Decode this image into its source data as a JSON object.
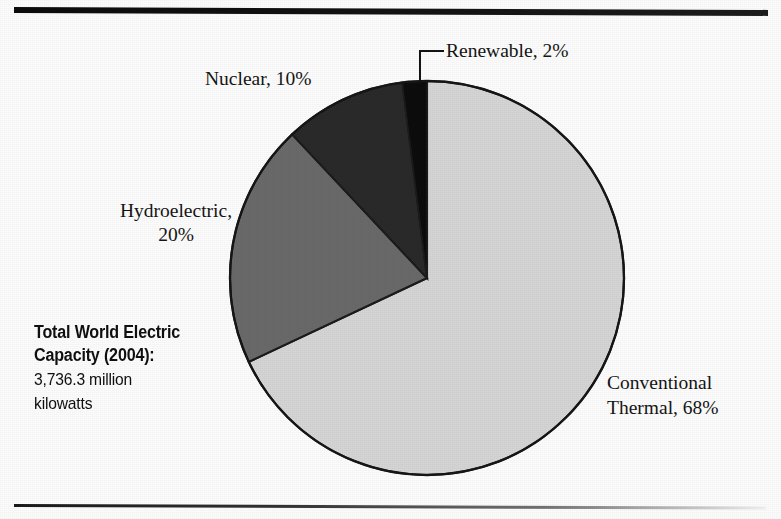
{
  "figure": {
    "top_rule": "horizontal-rule",
    "bottom_rule": "horizontal-rule"
  },
  "caption": {
    "heading_line1": "Total World Electric",
    "heading_line2": "Capacity (2004):",
    "value_line1": "3,736.3 million",
    "value_line2": "kilowatts"
  },
  "labels": {
    "renewable": "Renewable, 2%",
    "nuclear": "Nuclear, 10%",
    "hydro_line1": "Hydroelectric,",
    "hydro_line2": "20%",
    "thermal_line1": "Conventional",
    "thermal_line2": "Thermal, 68%"
  },
  "chart_data": {
    "type": "pie",
    "title": "Total World Electric Capacity (2004)",
    "subtitle": "3,736.3 million kilowatts",
    "total": "3,736.3 million kilowatts",
    "unit": "percent of total capacity",
    "start_angle_deg": 0,
    "direction": "clockwise",
    "legend": "labels-outside-with-leader-lines",
    "grid": false,
    "categories": [
      "Conventional Thermal",
      "Hydroelectric",
      "Nuclear",
      "Renewable"
    ],
    "values": [
      68,
      20,
      10,
      2
    ],
    "slices": [
      {
        "name": "Conventional Thermal",
        "value": 68,
        "label": "Conventional Thermal, 68%",
        "color": "#d6d6d6",
        "start_deg": 0,
        "end_deg": 244.8
      },
      {
        "name": "Hydroelectric",
        "value": 20,
        "label": "Hydroelectric, 20%",
        "color": "#6b6b6b",
        "start_deg": 244.8,
        "end_deg": 316.8
      },
      {
        "name": "Nuclear",
        "value": 10,
        "label": "Nuclear, 10%",
        "color": "#2b2b2b",
        "start_deg": 316.8,
        "end_deg": 352.8
      },
      {
        "name": "Renewable",
        "value": 2,
        "label": "Renewable, 2%",
        "color": "#0b0b0b",
        "start_deg": 352.8,
        "end_deg": 360
      }
    ]
  },
  "colors": {
    "conventional_thermal": "#d6d6d6",
    "hydroelectric": "#6b6b6b",
    "nuclear": "#2b2b2b",
    "renewable": "#0b0b0b",
    "outline": "#1c1c1c",
    "text": "#151515",
    "background": "#fdfdfd"
  }
}
